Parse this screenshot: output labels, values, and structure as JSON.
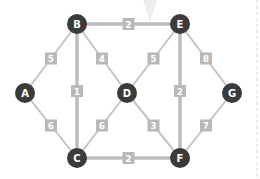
{
  "diagram": {
    "type": "weighted-graph",
    "colors": {
      "node": "#3b3b3b",
      "node_text": "#ffffff",
      "edge": "#c4c4c4",
      "weight_box": "#b8b8b8",
      "weight_text": "#ffffff"
    },
    "nodes": [
      {
        "id": "A",
        "label": "A",
        "x": 25,
        "y": 93
      },
      {
        "id": "B",
        "label": "B",
        "x": 77,
        "y": 24
      },
      {
        "id": "C",
        "label": "C",
        "x": 77,
        "y": 158
      },
      {
        "id": "D",
        "label": "D",
        "x": 127,
        "y": 93
      },
      {
        "id": "E",
        "label": "E",
        "x": 180,
        "y": 24
      },
      {
        "id": "F",
        "label": "F",
        "x": 180,
        "y": 158
      },
      {
        "id": "G",
        "label": "G",
        "x": 232,
        "y": 93
      }
    ],
    "edges": [
      {
        "from": "A",
        "to": "B",
        "weight": "5",
        "thick": false
      },
      {
        "from": "A",
        "to": "C",
        "weight": "6",
        "thick": false
      },
      {
        "from": "B",
        "to": "E",
        "weight": "2",
        "thick": true
      },
      {
        "from": "B",
        "to": "C",
        "weight": "1",
        "thick": true
      },
      {
        "from": "B",
        "to": "D",
        "weight": "4",
        "thick": false
      },
      {
        "from": "C",
        "to": "D",
        "weight": "6",
        "thick": false
      },
      {
        "from": "C",
        "to": "F",
        "weight": "2",
        "thick": true
      },
      {
        "from": "D",
        "to": "E",
        "weight": "5",
        "thick": false
      },
      {
        "from": "D",
        "to": "F",
        "weight": "3",
        "thick": false
      },
      {
        "from": "E",
        "to": "F",
        "weight": "2",
        "thick": true
      },
      {
        "from": "E",
        "to": "G",
        "weight": "8",
        "thick": false
      },
      {
        "from": "F",
        "to": "G",
        "weight": "7",
        "thick": false
      }
    ]
  }
}
